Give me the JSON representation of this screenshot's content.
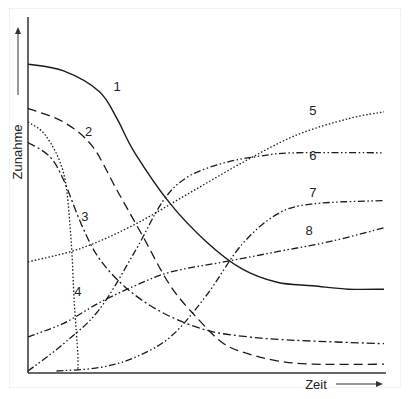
{
  "chart_data": {
    "type": "line",
    "title": "",
    "xlabel": "Zeit",
    "ylabel": "Zunahme",
    "xlim": [
      0,
      100
    ],
    "ylim": [
      0,
      100
    ],
    "grid": false,
    "legend": "none (curves labeled inline with numbers 1–8)",
    "series": [
      {
        "name": "1",
        "style": "solid",
        "x": [
          0,
          10,
          20,
          25,
          30,
          40,
          50,
          60,
          70,
          80,
          90,
          100
        ],
        "y": [
          90,
          88,
          82,
          74,
          64,
          49,
          38,
          30,
          26,
          25,
          24,
          24
        ]
      },
      {
        "name": "2",
        "style": "dashed",
        "x": [
          0,
          10,
          18,
          25,
          32,
          40,
          48,
          55,
          62,
          70,
          80,
          100
        ],
        "y": [
          77,
          73,
          66,
          53,
          40,
          25,
          15,
          8,
          5,
          3,
          2,
          2
        ]
      },
      {
        "name": "3",
        "style": "dashdot",
        "x": [
          0,
          6,
          10,
          15,
          20,
          28,
          38,
          50,
          62,
          75,
          100
        ],
        "y": [
          67,
          63,
          56,
          43,
          33,
          24,
          17,
          12,
          10,
          9,
          8
        ]
      },
      {
        "name": "4",
        "style": "dotted",
        "x": [
          0,
          5,
          10,
          12,
          13,
          14,
          14
        ],
        "y": [
          73,
          69,
          58,
          40,
          20,
          5,
          0
        ]
      },
      {
        "name": "5",
        "style": "dotted",
        "x": [
          0,
          15,
          30,
          45,
          60,
          75,
          90,
          100
        ],
        "y": [
          32,
          36,
          43,
          52,
          61,
          69,
          74,
          76
        ]
      },
      {
        "name": "6",
        "style": "dashdotdot",
        "x": [
          0,
          10,
          20,
          30,
          38,
          45,
          55,
          65,
          75,
          100
        ],
        "y": [
          0,
          8,
          18,
          35,
          50,
          57,
          61,
          63,
          64,
          64
        ]
      },
      {
        "name": "7",
        "style": "dashdotdot",
        "x": [
          8,
          20,
          30,
          40,
          50,
          60,
          70,
          80,
          100
        ],
        "y": [
          0,
          1,
          4,
          10,
          22,
          37,
          46,
          49,
          50
        ]
      },
      {
        "name": "8",
        "style": "dashdotdot",
        "x": [
          0,
          10,
          20,
          30,
          40,
          55,
          70,
          85,
          100
        ],
        "y": [
          10,
          14,
          20,
          25,
          29,
          32,
          35,
          38,
          42
        ]
      }
    ],
    "annotations": [
      {
        "text": "1",
        "x": 25,
        "y": 82
      },
      {
        "text": "2",
        "x": 17,
        "y": 69
      },
      {
        "text": "3",
        "x": 16,
        "y": 44
      },
      {
        "text": "4",
        "x": 14,
        "y": 22
      },
      {
        "text": "5",
        "x": 80,
        "y": 75
      },
      {
        "text": "6",
        "x": 80,
        "y": 62
      },
      {
        "text": "7",
        "x": 80,
        "y": 51
      },
      {
        "text": "8",
        "x": 79,
        "y": 40
      }
    ]
  }
}
